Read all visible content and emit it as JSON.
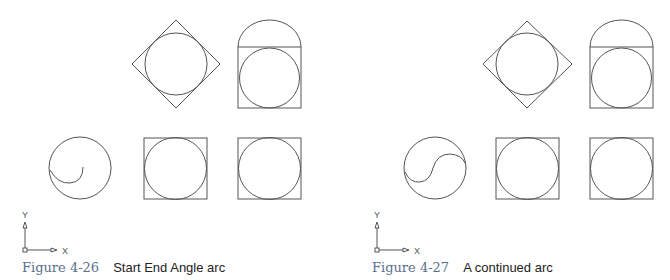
{
  "figures": [
    {
      "number": "Figure 4-26",
      "title": "Start End Angle arc",
      "axis": {
        "y_label": "Y",
        "x_label": "X"
      }
    },
    {
      "number": "Figure 4-27",
      "title": "A continued arc",
      "axis": {
        "y_label": "Y",
        "x_label": "X"
      }
    }
  ],
  "colors": {
    "line": "#555555",
    "caption_number": "#5a6f8a",
    "caption_text": "#222222"
  }
}
